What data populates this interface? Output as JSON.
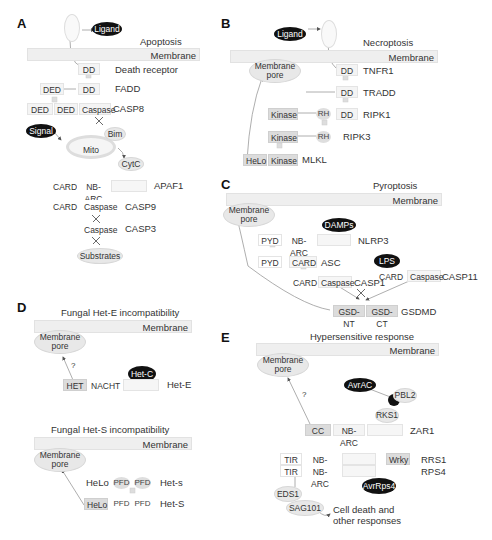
{
  "panels": {
    "A": {
      "letter": "A",
      "title": "Apoptosis",
      "membrane": "Membrane",
      "ligand": "Ligand",
      "death_receptor": {
        "domain": "DD",
        "label": "Death receptor"
      },
      "fadd": {
        "domains": [
          "DED",
          "DD"
        ],
        "label": "FADD"
      },
      "casp8": {
        "domains": [
          "DED",
          "DED",
          "Caspase"
        ],
        "label": "CASP8"
      },
      "signal": "Signal",
      "mito": "Mito",
      "bim": "Bim",
      "cytc": "CytC",
      "apaf1": {
        "domains": [
          "CARD",
          "NB-ARC"
        ],
        "label": "APAF1"
      },
      "casp9": {
        "domains": [
          "CARD",
          "Caspase"
        ],
        "label": "CASP9"
      },
      "casp3": {
        "domains": [
          "Caspase"
        ],
        "label": "CASP3"
      },
      "substrates": "Substrates"
    },
    "B": {
      "letter": "B",
      "title": "Necroptosis",
      "membrane": "Membrane",
      "ligand": "Ligand",
      "pore": [
        "Membrane",
        "pore"
      ],
      "tnfr1": {
        "domain": "DD",
        "label": "TNFR1"
      },
      "tradd": {
        "domain": "DD",
        "label": "TRADD"
      },
      "ripk1": {
        "domains": [
          "Kinase",
          "RH",
          "DD"
        ],
        "label": "RIPK1"
      },
      "ripk3": {
        "domains": [
          "Kinase",
          "RH"
        ],
        "label": "RIPK3"
      },
      "mlkl": {
        "domains": [
          "HeLo",
          "Kinase"
        ],
        "label": "MLKL"
      }
    },
    "C": {
      "letter": "C",
      "title": "Pyroptosis",
      "membrane": "Membrane",
      "pore": [
        "Membrane",
        "pore"
      ],
      "damps": "DAMPs",
      "nlrp3": {
        "domains": [
          "PYD",
          "NB-ARC"
        ],
        "label": "NLRP3"
      },
      "asc": {
        "domains": [
          "PYD",
          "CARD"
        ],
        "label": "ASC"
      },
      "lps": "LPS",
      "casp11": {
        "domains": [
          "CARD",
          "Caspase"
        ],
        "label": "CASP11"
      },
      "casp1": {
        "domains": [
          "CARD",
          "Caspase"
        ],
        "label": "CASP1"
      },
      "gsdmd": {
        "domains": [
          "GSD-NT",
          "GSD-CT"
        ],
        "label": "GSDMD"
      }
    },
    "D": {
      "letter": "D",
      "title_e": "Fungal Het-E incompatibility",
      "membrane_e": "Membrane",
      "pore_e": [
        "Membrane",
        "pore"
      ],
      "question": "?",
      "hetc": "Het-C",
      "hete": {
        "domains": [
          "HET",
          "NACHT"
        ],
        "label": "Het-E"
      },
      "title_s": "Fungal Het-S incompatibility",
      "membrane_s": "Membrane",
      "pore_s": [
        "Membrane",
        "pore"
      ],
      "het_s_small": {
        "domains": [
          "HeLo",
          "PFD",
          "PFD"
        ],
        "label": "Het-s"
      },
      "het_s_big": {
        "domains": [
          "HeLo",
          "PFD",
          "PFD"
        ],
        "label": "Het-S"
      }
    },
    "E": {
      "letter": "E",
      "title": "Hypersensitive response",
      "membrane": "Membrane",
      "pore": [
        "Membrane",
        "pore"
      ],
      "question": "?",
      "avrac": "AvrAC",
      "pbl2": "PBL2",
      "rks1": "RKS1",
      "zar1": {
        "domains": [
          "CC",
          "NB-ARC"
        ],
        "label": "ZAR1"
      },
      "rrs1": {
        "domains": [
          "TIR",
          "NB-ARC",
          "Wrky"
        ],
        "label": "RRS1"
      },
      "rps4": {
        "domains": [
          "TIR",
          "NB-ARC"
        ],
        "label": "RPS4"
      },
      "avrrps4": "AvrRps4",
      "eds1": "EDS1",
      "sag101": "SAG101",
      "outcome": [
        "Cell death and",
        "other responses"
      ]
    }
  }
}
